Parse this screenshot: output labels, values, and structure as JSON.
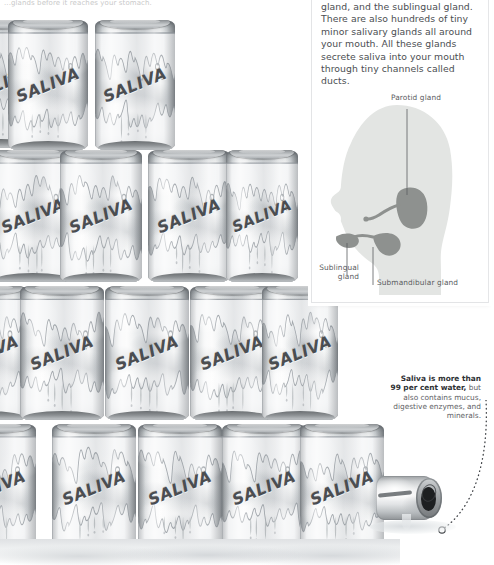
{
  "top_cut_text": "...glands before it reaches your stomach.",
  "panel": {
    "paragraph": "gland, and the sublingual gland. There are also hundreds of tiny minor salivary glands all around your mouth. All these glands secrete saliva into your mouth through tiny channels called ducts."
  },
  "figure": {
    "labels": {
      "parotid": "Parotid gland",
      "sublingual_line1": "Sublingual",
      "sublingual_line2": "gland",
      "submandibular": "Submandibular gland"
    },
    "colors": {
      "head": "#e3e5e3",
      "gland": "#8e918f",
      "leader": "#5a5d61",
      "label_text": "#5a5d61"
    }
  },
  "caption": {
    "bold_line1": "Saliva is more than",
    "bold_line2": "99 per cent water,",
    "rest": " but also contains mucus, digestive enzymes, and minerals."
  },
  "cans": {
    "brand": "SALIVA",
    "rows": [
      {
        "top": 14,
        "items": [
          {
            "left": -38,
            "width": 78,
            "height": 128,
            "font": 16
          },
          {
            "left": 8,
            "width": 80,
            "height": 130,
            "font": 16
          },
          {
            "left": 95,
            "width": 80,
            "height": 130,
            "font": 16
          }
        ]
      },
      {
        "top": 144,
        "items": [
          {
            "left": -48,
            "width": 80,
            "height": 132,
            "font": 16
          },
          {
            "left": -8,
            "width": 82,
            "height": 132,
            "font": 16
          },
          {
            "left": 60,
            "width": 82,
            "height": 132,
            "font": 16
          },
          {
            "left": 148,
            "width": 82,
            "height": 132,
            "font": 16
          },
          {
            "left": 226,
            "width": 72,
            "height": 132,
            "font": 15
          }
        ]
      },
      {
        "top": 280,
        "items": [
          {
            "left": -54,
            "width": 82,
            "height": 134,
            "font": 16
          },
          {
            "left": 20,
            "width": 84,
            "height": 134,
            "font": 16
          },
          {
            "left": 105,
            "width": 84,
            "height": 134,
            "font": 16
          },
          {
            "left": 190,
            "width": 84,
            "height": 134,
            "font": 16
          },
          {
            "left": 262,
            "width": 76,
            "height": 134,
            "font": 16
          }
        ]
      },
      {
        "top": 418,
        "items": [
          {
            "left": -48,
            "width": 84,
            "height": 128,
            "font": 16
          },
          {
            "left": 52,
            "width": 84,
            "height": 128,
            "font": 16
          },
          {
            "left": 138,
            "width": 84,
            "height": 128,
            "font": 16
          },
          {
            "left": 222,
            "width": 84,
            "height": 128,
            "font": 16
          },
          {
            "left": 300,
            "width": 84,
            "height": 128,
            "font": 16
          }
        ]
      }
    ]
  },
  "tipped_can": {
    "name": "tipped-spilling-can"
  },
  "colors": {
    "background": "#ffffff",
    "panel_bg": "#ffffff",
    "panel_border": "#e3e4e6",
    "body_text": "#4b4e52",
    "can_text": "#4a4d51"
  }
}
